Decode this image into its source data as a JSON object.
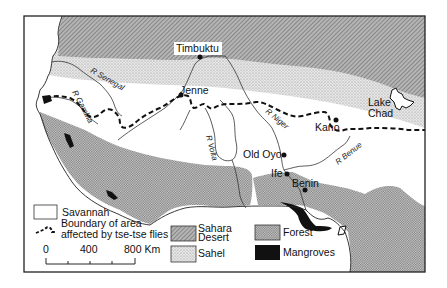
{
  "map": {
    "places": [
      {
        "name": "Timbuktu",
        "x": 200,
        "y": 56
      },
      {
        "name": "Jenne",
        "x": 181,
        "y": 93
      },
      {
        "name": "Kano",
        "x": 336,
        "y": 120
      },
      {
        "name": "Old Oyo",
        "x": 284,
        "y": 155
      },
      {
        "name": "Ife",
        "x": 286,
        "y": 174
      },
      {
        "name": "Benin",
        "x": 305,
        "y": 190
      }
    ],
    "lake": {
      "name_line1": "Lake",
      "name_line2": "Chad"
    },
    "rivers": {
      "senegal": "R Senegal",
      "gambia": "R Gambia",
      "volta": "R Volta",
      "niger": "R Niger",
      "benue": "R Benue"
    }
  },
  "legend": {
    "savannah": "Savannah",
    "boundary_line1": "Boundary of area",
    "boundary_line2": "affected by tse-tse flies",
    "sahara_line1": "Sahara",
    "sahara_line2": "Desert",
    "sahel": "Sahel",
    "forest": "Forest",
    "mangroves": "Mangroves"
  },
  "scale": {
    "tick_0": "0",
    "tick_400": "400",
    "tick_800": "800 Km"
  },
  "colors": {
    "desert": "#9a9a9a",
    "sahel": "#d4d4d4",
    "forest": "#bdbdbd",
    "mangrove": "#111111",
    "savannah": "#ffffff",
    "frame": "#222222"
  }
}
